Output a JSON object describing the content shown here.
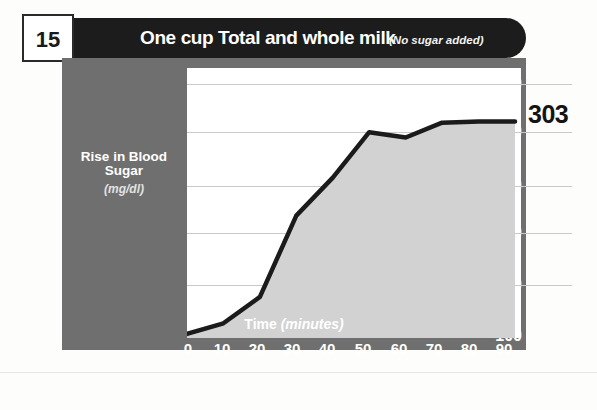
{
  "header": {
    "number": "15",
    "title": "One cup Total and whole milk",
    "subtitle": "(No sugar added)"
  },
  "chart_data": {
    "type": "area",
    "title": "One cup Total and whole milk",
    "subtitle": "(No sugar added)",
    "xlabel": "Time",
    "xlabel_units": "(minutes)",
    "ylabel": "Rise in Blood Sugar",
    "ylabel_units": "(mg/dl)",
    "xlim": [
      0,
      90
    ],
    "ylim": [
      100,
      350
    ],
    "xticks": [
      0,
      10,
      20,
      30,
      40,
      50,
      60,
      70,
      80,
      90
    ],
    "yticks": [
      100,
      150,
      200,
      250,
      300,
      350
    ],
    "grid": true,
    "legend": "none",
    "x": [
      0,
      10,
      20,
      30,
      40,
      50,
      60,
      70,
      80,
      90
    ],
    "values": [
      102,
      112,
      137,
      214,
      250,
      293,
      288,
      302,
      303,
      303
    ],
    "end_annotation": "303",
    "line_color": "#1b1b1b",
    "fill_color": "#d2d2d2",
    "panel_color": "#6e6f6e",
    "grid_color": "#c9c9c9"
  },
  "axis_labels": {
    "y": [
      "350",
      "300",
      "250",
      "200",
      "150",
      "100"
    ],
    "x": [
      "0",
      "10",
      "20",
      "30",
      "40",
      "50",
      "60",
      "70",
      "80",
      "90"
    ]
  },
  "footer": {
    "smudge": ""
  }
}
